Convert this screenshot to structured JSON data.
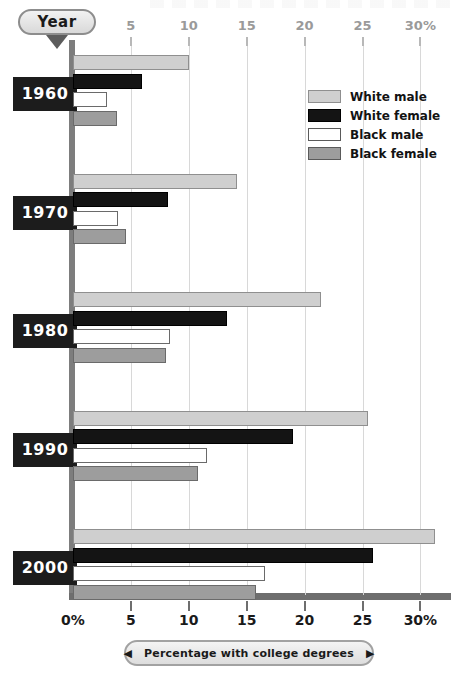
{
  "axis": {
    "year_pill_label": "Year",
    "top_ticks": [
      "5",
      "10",
      "15",
      "20",
      "25",
      "30%"
    ],
    "bottom_ticks": [
      "0%",
      "5",
      "10",
      "15",
      "20",
      "25",
      "30%"
    ],
    "caption": "Percentage with college degrees",
    "caption_left_arrow": "◀",
    "caption_right_arrow": "▶"
  },
  "legend": {
    "items": [
      {
        "label": "White male",
        "color": "#cfcfcf"
      },
      {
        "label": "White female",
        "color": "#141414"
      },
      {
        "label": "Black male",
        "color": "#ffffff"
      },
      {
        "label": "Black female",
        "color": "#9d9d9d"
      }
    ]
  },
  "year_labels": [
    "1960",
    "1970",
    "1980",
    "1990",
    "2000"
  ],
  "chart_data": {
    "type": "bar",
    "title": "Percentage with college degrees",
    "orientation": "horizontal",
    "grouped": true,
    "xlabel": "Percentage with college degrees",
    "ylabel": "Year",
    "xlim": [
      0,
      31.5
    ],
    "xticks": [
      0,
      5,
      10,
      15,
      20,
      25,
      30
    ],
    "xtick_labels": [
      "0%",
      "5",
      "10",
      "15",
      "20",
      "25",
      "30%"
    ],
    "grid": true,
    "legend_position": "top-right",
    "categories": [
      "1960",
      "1970",
      "1980",
      "1990",
      "2000"
    ],
    "series": [
      {
        "name": "White male",
        "color": "#cfcfcf",
        "values": [
          10.0,
          14.2,
          21.4,
          25.5,
          31.3
        ]
      },
      {
        "name": "White female",
        "color": "#141414",
        "values": [
          6.0,
          8.2,
          13.3,
          19.0,
          25.9
        ]
      },
      {
        "name": "Black male",
        "color": "#ffffff",
        "values": [
          2.9,
          3.9,
          8.4,
          11.6,
          16.6
        ]
      },
      {
        "name": "Black female",
        "color": "#9d9d9d",
        "values": [
          3.8,
          4.6,
          8.0,
          10.8,
          15.8
        ]
      }
    ]
  }
}
